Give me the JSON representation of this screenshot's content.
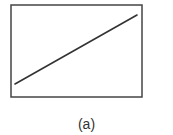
{
  "figure": {
    "caption": "(a)",
    "frame": {
      "x": 11,
      "y": 5,
      "width": 131,
      "height": 92,
      "stroke": "#444444"
    },
    "line": {
      "x1": 15,
      "y1": 84,
      "x2": 137,
      "y2": 15,
      "stroke": "#333333"
    }
  },
  "chart_data": {
    "type": "line",
    "title": "",
    "xlabel": "",
    "ylabel": "",
    "series": [
      {
        "name": "line",
        "x": [
          0,
          1
        ],
        "y": [
          0,
          1
        ]
      }
    ],
    "grid": false,
    "legend": null,
    "caption": "(a)"
  }
}
